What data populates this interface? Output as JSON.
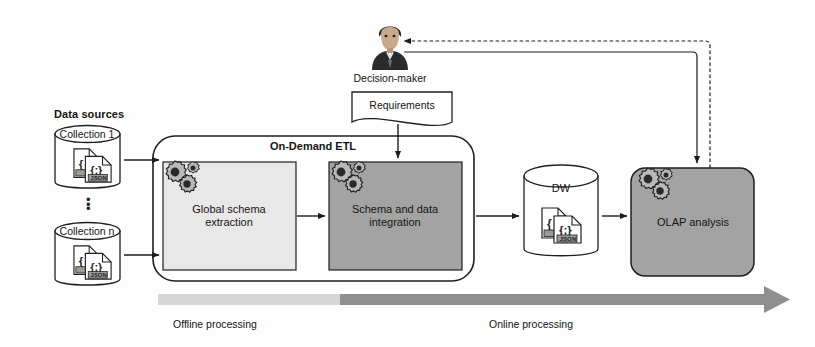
{
  "figure": {
    "background": "#fdfdfd"
  },
  "palette": {
    "stroke": "#1c1c1c",
    "light_box_fill": "#e8e8e8",
    "dark_box_fill": "#a3a3a3",
    "olap_fill": "#a3a3a3",
    "cylinder_fill": "#ffffff",
    "offline_bar": "#d6d6d6",
    "online_bar": "#8f8f8f",
    "gear_body": "#b9b9b9",
    "gear_hub": "#2a2a2a",
    "person_suit": "#2b2b2b",
    "person_skin": "#c9a98c"
  },
  "data_sources": {
    "label": "Data sources",
    "collections": [
      {
        "name": "Collection 1",
        "icon": "json-documents-icon"
      },
      {
        "name": "Collection n",
        "icon": "json-documents-icon"
      }
    ],
    "ellipsis": "⋮",
    "doc_badge": "JSON",
    "doc_glyph_left": "{",
    "doc_glyph_right": "{;}"
  },
  "etl": {
    "title": "On-Demand ETL",
    "stages": [
      {
        "id": "global-schema-extraction",
        "line1": "Global schema",
        "line2": "extraction",
        "fill": "#e8e8e8",
        "icon": "gears-icon"
      },
      {
        "id": "schema-and-data-integration",
        "line1": "Schema and data",
        "line2": "integration",
        "fill": "#a3a3a3",
        "icon": "gears-icon"
      }
    ]
  },
  "decision_maker": {
    "label": "Decision-maker",
    "icon": "businessperson-avatar-icon"
  },
  "requirements": {
    "label": "Requirements",
    "shape": "document"
  },
  "warehouse": {
    "label": "DW",
    "icon": "json-documents-icon",
    "shape": "cylinder"
  },
  "olap": {
    "label": "OLAP analysis",
    "icon": "gears-icon",
    "fill": "#a3a3a3"
  },
  "timeline": {
    "phases": [
      {
        "label": "Offline processing",
        "color": "#d6d6d6"
      },
      {
        "label": "Online processing",
        "color": "#8f8f8f"
      }
    ],
    "arrow": "right-arrow-icon"
  },
  "connectors": [
    {
      "id": "collection1-to-extraction",
      "style": "solid",
      "arrow": "right"
    },
    {
      "id": "collectionN-to-extraction",
      "style": "solid",
      "arrow": "right"
    },
    {
      "id": "extraction-to-integration",
      "style": "solid",
      "arrow": "right"
    },
    {
      "id": "requirements-to-integration",
      "style": "solid",
      "arrow": "down"
    },
    {
      "id": "etl-to-dw",
      "style": "solid",
      "arrow": "right"
    },
    {
      "id": "dw-to-olap",
      "style": "solid",
      "arrow": "right"
    },
    {
      "id": "olap-to-decision-maker",
      "style": "dashed",
      "arrow": "left"
    },
    {
      "id": "decision-maker-to-olap",
      "style": "solid",
      "arrow": "down"
    }
  ]
}
